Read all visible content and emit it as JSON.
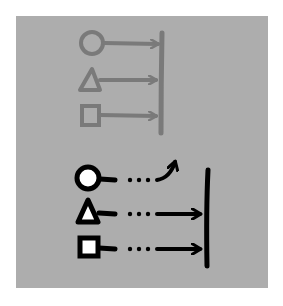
{
  "diagram": {
    "colors": {
      "background": "#ffffff",
      "panel": "#adadad",
      "top_stroke": "#7a7a7a",
      "bottom_stroke": "#000000",
      "bottom_fill": "#ffffff"
    },
    "top_group": {
      "style": "gray outlined, solid arrows to bar",
      "items": [
        {
          "shape": "circle",
          "connector": "solid-arrow",
          "target": "bar"
        },
        {
          "shape": "triangle",
          "connector": "solid-arrow",
          "target": "bar"
        },
        {
          "shape": "square",
          "connector": "solid-arrow",
          "target": "bar"
        }
      ]
    },
    "bottom_group": {
      "style": "black outlined white fill, dotted connectors",
      "items": [
        {
          "shape": "circle",
          "connector": "dotted-curved-arrow",
          "target": "up-away"
        },
        {
          "shape": "triangle",
          "connector": "dotted-arrow",
          "target": "bar"
        },
        {
          "shape": "square",
          "connector": "dotted-arrow",
          "target": "bar"
        }
      ]
    }
  }
}
